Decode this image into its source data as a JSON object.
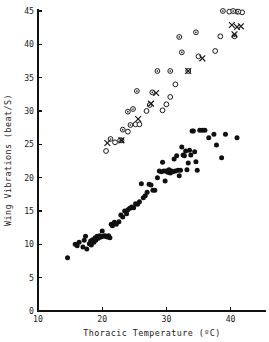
{
  "chart_data": {
    "type": "scatter",
    "title": "",
    "xlabel": "Thoracic Temperature (ºC)",
    "ylabel": "Wing Vibrations (beat/S)",
    "xlim": [
      10,
      44
    ],
    "ylim": [
      0,
      45
    ],
    "xticks": [
      10,
      20,
      30,
      40
    ],
    "xtick_labels": [
      "10",
      "20",
      "30",
      "40"
    ],
    "yticks": [
      0,
      5,
      10,
      15,
      20,
      25,
      30,
      35,
      40,
      45
    ],
    "ytick_labels": [
      "0",
      "5",
      "10",
      "15",
      "20",
      "25",
      "30",
      "35",
      "40",
      "45"
    ],
    "grid": false,
    "legend": "none",
    "series": [
      {
        "name": "filled-circles",
        "marker": "filled-circle",
        "points": [
          [
            14.6,
            8.0
          ],
          [
            15.8,
            10.0
          ],
          [
            16.1,
            9.8
          ],
          [
            16.4,
            10.3
          ],
          [
            17.0,
            9.6
          ],
          [
            17.2,
            10.6
          ],
          [
            17.4,
            11.2
          ],
          [
            17.6,
            9.3
          ],
          [
            18.0,
            10.1
          ],
          [
            18.2,
            10.5
          ],
          [
            18.3,
            9.9
          ],
          [
            18.5,
            10.7
          ],
          [
            18.7,
            10.3
          ],
          [
            18.9,
            11.0
          ],
          [
            19.0,
            10.6
          ],
          [
            19.2,
            11.2
          ],
          [
            19.4,
            10.9
          ],
          [
            19.6,
            11.3
          ],
          [
            19.8,
            11.1
          ],
          [
            20.0,
            12.0
          ],
          [
            20.2,
            11.2
          ],
          [
            20.4,
            11.3
          ],
          [
            20.6,
            11.2
          ],
          [
            20.8,
            11.1
          ],
          [
            21.0,
            11.3
          ],
          [
            21.2,
            11.0
          ],
          [
            21.4,
            13.0
          ],
          [
            21.6,
            12.8
          ],
          [
            21.9,
            13.3
          ],
          [
            22.2,
            13.0
          ],
          [
            22.6,
            13.4
          ],
          [
            22.9,
            14.4
          ],
          [
            23.2,
            14.1
          ],
          [
            23.5,
            15.0
          ],
          [
            23.8,
            14.6
          ],
          [
            24.0,
            15.2
          ],
          [
            24.3,
            15.4
          ],
          [
            24.6,
            15.6
          ],
          [
            24.9,
            15.5
          ],
          [
            25.2,
            16.1
          ],
          [
            25.5,
            16.0
          ],
          [
            25.8,
            16.4
          ],
          [
            26.1,
            19.1
          ],
          [
            26.4,
            17.0
          ],
          [
            26.7,
            17.3
          ],
          [
            27.0,
            17.8
          ],
          [
            27.3,
            19.0
          ],
          [
            27.6,
            18.9
          ],
          [
            27.9,
            18.1
          ],
          [
            28.2,
            18.1
          ],
          [
            28.6,
            20.0
          ],
          [
            28.9,
            21.0
          ],
          [
            29.2,
            20.9
          ],
          [
            29.4,
            22.3
          ],
          [
            29.6,
            21.0
          ],
          [
            29.8,
            19.5
          ],
          [
            30.0,
            21.0
          ],
          [
            30.2,
            20.8
          ],
          [
            30.4,
            21.2
          ],
          [
            30.6,
            20.7
          ],
          [
            30.8,
            21.0
          ],
          [
            31.0,
            20.9
          ],
          [
            31.2,
            22.8
          ],
          [
            31.4,
            21.0
          ],
          [
            31.6,
            23.3
          ],
          [
            31.8,
            21.1
          ],
          [
            32.0,
            20.3
          ],
          [
            32.2,
            21.1
          ],
          [
            32.4,
            24.6
          ],
          [
            32.6,
            23.4
          ],
          [
            32.8,
            23.3
          ],
          [
            33.0,
            24.0
          ],
          [
            33.2,
            21.2
          ],
          [
            33.4,
            22.2
          ],
          [
            33.6,
            24.1
          ],
          [
            33.8,
            23.4
          ],
          [
            34.0,
            27.0
          ],
          [
            34.2,
            27.0
          ],
          [
            34.4,
            23.9
          ],
          [
            34.6,
            22.4
          ],
          [
            34.8,
            21.1
          ],
          [
            35.2,
            27.1
          ],
          [
            35.6,
            27.1
          ],
          [
            36.0,
            27.1
          ],
          [
            36.6,
            26.0
          ],
          [
            37.4,
            26.5
          ],
          [
            37.8,
            24.9
          ],
          [
            38.6,
            23.0
          ],
          [
            39.2,
            26.5
          ],
          [
            41.0,
            26.0
          ]
        ]
      },
      {
        "name": "open-circles",
        "marker": "open-circle",
        "points": [
          [
            20.6,
            24.0
          ],
          [
            22.0,
            25.3
          ],
          [
            23.0,
            25.6
          ],
          [
            24.0,
            26.9
          ],
          [
            25.2,
            28.0
          ],
          [
            25.8,
            28.0
          ],
          [
            26.9,
            30.0
          ],
          [
            27.4,
            30.9
          ],
          [
            29.4,
            30.1
          ],
          [
            30.0,
            31.0
          ],
          [
            30.6,
            32.1
          ],
          [
            31.4,
            34.0
          ],
          [
            33.4,
            36.0
          ],
          [
            35.0,
            38.2
          ],
          [
            37.6,
            39.0
          ],
          [
            38.4,
            41.2
          ],
          [
            39.8,
            44.9
          ],
          [
            41.0,
            44.9
          ],
          [
            41.8,
            44.8
          ]
        ]
      },
      {
        "name": "dotted-circles",
        "marker": "dotted-circle",
        "points": [
          [
            21.3,
            25.8
          ],
          [
            22.8,
            25.6
          ],
          [
            23.2,
            27.2
          ],
          [
            24.4,
            27.9
          ],
          [
            24.0,
            29.9
          ],
          [
            24.8,
            30.3
          ],
          [
            25.4,
            33.0
          ],
          [
            27.8,
            32.8
          ],
          [
            28.6,
            36.0
          ],
          [
            30.6,
            36.0
          ],
          [
            32.4,
            38.8
          ],
          [
            32.0,
            41.1
          ],
          [
            34.6,
            41.8
          ],
          [
            38.8,
            45.0
          ],
          [
            40.4,
            45.0
          ],
          [
            41.2,
            44.9
          ],
          [
            40.6,
            41.2
          ]
        ]
      },
      {
        "name": "crosses",
        "marker": "cross",
        "points": [
          [
            20.8,
            25.2
          ],
          [
            23.0,
            25.6
          ],
          [
            25.6,
            28.8
          ],
          [
            27.6,
            31.1
          ],
          [
            28.4,
            32.7
          ],
          [
            33.4,
            36.0
          ],
          [
            35.6,
            37.9
          ],
          [
            40.2,
            42.9
          ],
          [
            41.0,
            42.6
          ],
          [
            41.6,
            42.7
          ],
          [
            40.6,
            41.5
          ]
        ]
      }
    ]
  },
  "axes": {
    "x_title": "Thoracic Temperature (ºC)",
    "y_title": "Wing Vibrations (beat/S)",
    "x_tick_labels": [
      "10",
      "20",
      "30",
      "40"
    ],
    "y_tick_labels": [
      "0",
      "5",
      "10",
      "15",
      "20",
      "25",
      "30",
      "35",
      "40",
      "45"
    ]
  },
  "colors": {
    "axis": "#111111",
    "filled_marker": "#101010",
    "open_marker_stroke": "#1a1a1a",
    "background": "#ffffff"
  }
}
